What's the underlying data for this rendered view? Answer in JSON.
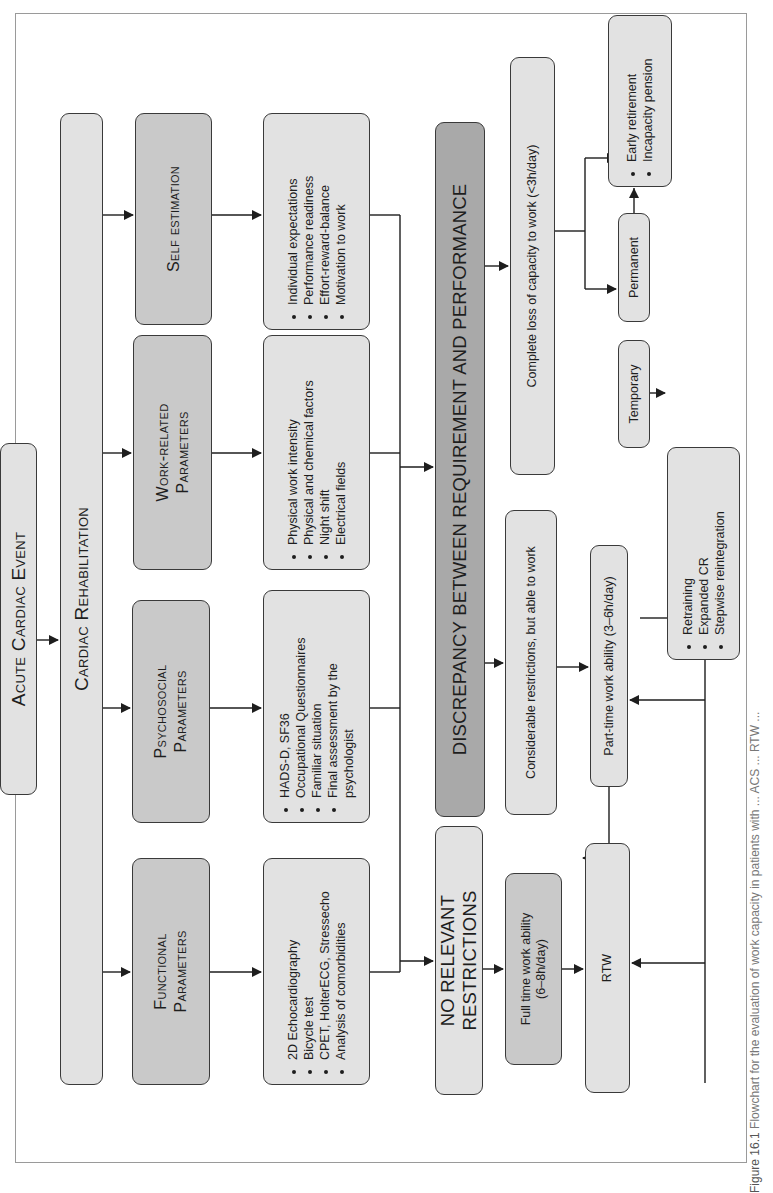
{
  "orientation": "rotated 90 degrees counter-clockwise",
  "nodes": {
    "acute_event": "Acute Cardiac Event",
    "cardiac_rehab": "Cardiac Rehabilitation",
    "functional": {
      "title_line1": "Functional",
      "title_line2": "Parameters",
      "items": [
        "2D Echocardiography",
        "Bicycle test",
        "CPET, HolterECG, Stressecho",
        "Analysis of comorbidities"
      ]
    },
    "psychosocial": {
      "title_line1": "Psychosocial",
      "title_line2": "Parameters",
      "items": [
        "HADS-D, SF36",
        "Occupational Questionnaires",
        "Familiar situation",
        "Final assessment by the psychologist"
      ]
    },
    "work_related": {
      "title_line1": "Work-related",
      "title_line2": "Parameters",
      "items": [
        "Physical work intensity",
        "Physical and chemical factors",
        "Night shift",
        "Electrical fields"
      ]
    },
    "self_estimation": {
      "title": "Self estimation",
      "items": [
        "Individual expectations",
        "Performance readiness",
        "Effort-reward-balance",
        "Motivation to work"
      ]
    },
    "no_restrictions": "No relevant restrictions",
    "discrepancy": "Discrepancy between requirement and performance",
    "full_time": {
      "line1": "Full time work ability",
      "line2": "(6–8h/day)"
    },
    "considerable": "Considerable restrictions, but able to work",
    "complete_loss": "Complete loss of capacity to work (<3h/day)",
    "part_time": "Part-time work ability (3–6h/day)",
    "rtw": "RTW",
    "temporary": "Temporary",
    "permanent": "Permanent",
    "reintegration": {
      "items": [
        "Retraining",
        "Expanded CR",
        "Stepwise reintegration"
      ]
    },
    "retirement": {
      "items": [
        "Early retirement",
        "Incapacity pension"
      ]
    }
  },
  "caption": {
    "label": "Figure 16.1",
    "text": "Flowchart for the evaluation of work capacity in patients with ... ACS ... RTW ..."
  },
  "colors": {
    "light_box": "#e2e2e2",
    "mid_box": "#c9c9c9",
    "dark_box": "#a9a9a9",
    "line": "#1e1e1e"
  }
}
